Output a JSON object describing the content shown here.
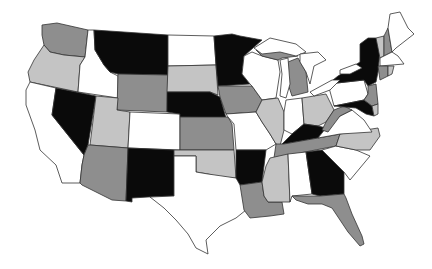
{
  "palette": {
    "black": "#0a0a0a",
    "dark_gray": "#8e8e8e",
    "light_gray": "#c4c4c4",
    "white": "#ffffff",
    "border": "#333333"
  },
  "states": [
    {
      "id": "WA",
      "fill": "#8e8e8e",
      "points": "42,25 57,23 88,30 85,57 64,55 50,52 44,45 42,35"
    },
    {
      "id": "OR",
      "fill": "#c4c4c4",
      "points": "44,45 50,52 64,55 85,57 80,65 78,92 30,82 28,72 34,60"
    },
    {
      "id": "CA",
      "fill": "#ffffff",
      "points": "30,82 56,88 52,115 84,155 82,165 80,183 62,183 56,165 40,150 35,130 26,105 26,90"
    },
    {
      "id": "ID",
      "fill": "#ffffff",
      "points": "88,30 94,30 95,50 104,65 110,72 118,76 118,98 78,92 80,65 85,57"
    },
    {
      "id": "NV",
      "fill": "#0a0a0a",
      "points": "56,88 96,96 88,145 84,155 52,115"
    },
    {
      "id": "MT",
      "fill": "#0a0a0a",
      "points": "94,30 168,35 168,75 118,74 110,72 104,65 95,50"
    },
    {
      "id": "WY",
      "fill": "#8e8e8e",
      "points": "118,74 168,75 167,112 117,110"
    },
    {
      "id": "UT",
      "fill": "#c4c4c4",
      "points": "96,96 118,98 117,110 130,112 128,148 90,145"
    },
    {
      "id": "CO",
      "fill": "#ffffff",
      "points": "130,112 180,114 180,150 128,148"
    },
    {
      "id": "AZ",
      "fill": "#8e8e8e",
      "points": "90,145 128,148 126,201 112,200 82,185 80,183 82,165 84,155 88,145"
    },
    {
      "id": "NM",
      "fill": "#0a0a0a",
      "points": "128,148 174,150 174,196 148,197 132,198 132,202 126,201"
    },
    {
      "id": "ND",
      "fill": "#ffffff",
      "points": "168,35 214,36 216,65 168,66"
    },
    {
      "id": "SD",
      "fill": "#c4c4c4",
      "points": "168,66 216,65 218,95 210,92 167,92"
    },
    {
      "id": "NE",
      "fill": "#0a0a0a",
      "points": "167,92 210,92 220,97 226,118 180,117 180,114 167,112"
    },
    {
      "id": "KS",
      "fill": "#8e8e8e",
      "points": "180,117 228,117 232,124 234,150 180,150"
    },
    {
      "id": "OK",
      "fill": "#c4c4c4",
      "points": "174,150 234,150 236,178 220,177 208,174 196,172 196,156 174,156"
    },
    {
      "id": "TX",
      "fill": "#ffffff",
      "points": "174,156 196,156 196,172 208,174 236,178 244,185 246,210 236,218 220,226 206,240 208,254 196,248 188,234 176,220 164,208 150,197 174,196"
    },
    {
      "id": "MN",
      "fill": "#0a0a0a",
      "points": "214,36 232,34 240,36 262,40 244,56 242,74 250,84 218,86 216,65"
    },
    {
      "id": "IA",
      "fill": "#8e8e8e",
      "points": "218,86 252,86 262,100 256,112 226,114 220,97"
    },
    {
      "id": "MO",
      "fill": "#ffffff",
      "points": "226,114 256,112 262,122 270,134 276,144 266,150 236,150 234,124 228,117"
    },
    {
      "id": "AR",
      "fill": "#0a0a0a",
      "points": "236,150 266,150 262,182 240,185 236,178"
    },
    {
      "id": "LA",
      "fill": "#8e8e8e",
      "points": "240,185 262,182 264,196 268,202 282,202 284,214 270,216 250,218 244,210"
    },
    {
      "id": "WI",
      "fill": "#ffffff",
      "points": "244,56 252,52 262,56 278,60 280,72 276,98 262,100 252,86 250,84 242,74"
    },
    {
      "id": "IL",
      "fill": "#c4c4c4",
      "points": "262,100 278,98 284,112 284,130 280,146 276,144 270,134 262,122 256,112"
    },
    {
      "id": "MI_UP",
      "fill": "#8e8e8e",
      "points": "256,50 272,44 292,50 298,56 282,58 278,60 262,56"
    },
    {
      "id": "MI",
      "fill": "#8e8e8e",
      "points": "288,62 298,58 306,72 308,92 292,96 288,84"
    },
    {
      "id": "IN",
      "fill": "#ffffff",
      "points": "286,100 302,98 304,124 292,134 284,130 284,112"
    },
    {
      "id": "OH",
      "fill": "#c4c4c4",
      "points": "302,98 326,94 334,110 326,122 318,126 304,124"
    },
    {
      "id": "KY",
      "fill": "#0a0a0a",
      "points": "280,146 292,134 304,124 318,126 326,128 318,138 284,144"
    },
    {
      "id": "TN",
      "fill": "#8e8e8e",
      "points": "276,144 284,144 318,138 340,134 336,146 274,158"
    },
    {
      "id": "MS",
      "fill": "#c4c4c4",
      "points": "270,158 288,154 290,202 268,202 264,196 262,182 266,166"
    },
    {
      "id": "AL",
      "fill": "#ffffff",
      "points": "288,154 306,152 312,194 292,196 290,202"
    },
    {
      "id": "GA",
      "fill": "#0a0a0a",
      "points": "306,152 322,150 344,172 344,194 320,196 312,194"
    },
    {
      "id": "FL",
      "fill": "#8e8e8e",
      "points": "292,196 320,196 344,194 346,198 352,214 362,236 364,244 360,246 348,232 340,220 332,208 322,204 308,204 296,200"
    },
    {
      "id": "SC",
      "fill": "#ffffff",
      "points": "336,146 356,150 370,156 350,180 344,172 322,150"
    },
    {
      "id": "NC",
      "fill": "#c4c4c4",
      "points": "340,134 378,128 380,136 370,150 356,150 336,146"
    },
    {
      "id": "VA",
      "fill": "#ffffff",
      "points": "326,128 340,116 352,110 364,120 372,132 340,134 318,138"
    },
    {
      "id": "WV",
      "fill": "#8e8e8e",
      "points": "326,122 334,110 344,106 352,110 340,116 328,132 322,130"
    },
    {
      "id": "PA",
      "fill": "#ffffff",
      "points": "328,84 364,80 368,94 364,100 334,106"
    },
    {
      "id": "NY",
      "fill": "#0a0a0a",
      "points": "338,76 360,62 360,44 368,38 376,38 380,50 378,72 376,82 368,86 364,80 328,84"
    },
    {
      "id": "MD",
      "fill": "#0a0a0a",
      "points": "334,106 364,100 372,106 374,116 366,114 356,108"
    },
    {
      "id": "NJ",
      "fill": "#8e8e8e",
      "points": "368,86 376,84 378,104 372,106 364,100 368,94"
    },
    {
      "id": "DE",
      "fill": "#c4c4c4",
      "points": "372,106 378,104 378,114 374,116"
    },
    {
      "id": "VT",
      "fill": "#c4c4c4",
      "points": "376,38 384,36 384,56 380,58"
    },
    {
      "id": "NH",
      "fill": "#8e8e8e",
      "points": "384,36 388,28 392,52 384,56"
    },
    {
      "id": "ME",
      "fill": "#ffffff",
      "points": "388,28 390,14 400,12 408,28 414,34 396,48 392,52"
    },
    {
      "id": "MA",
      "fill": "#ffffff",
      "points": "380,58 384,56 392,52 398,56 404,64 380,66"
    },
    {
      "id": "CT",
      "fill": "#8e8e8e",
      "points": "378,66 388,66 388,76 380,80"
    },
    {
      "id": "RI",
      "fill": "#c4c4c4",
      "points": "388,66 394,66 392,74 388,76"
    }
  ]
}
